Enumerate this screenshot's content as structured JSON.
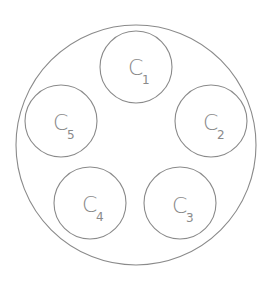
{
  "diagram": {
    "outer": {
      "name": "outer-circle"
    },
    "circles": [
      {
        "id": "c1",
        "letter": "C",
        "sub": "1"
      },
      {
        "id": "c2",
        "letter": "C",
        "sub": "2"
      },
      {
        "id": "c3",
        "letter": "C",
        "sub": "3"
      },
      {
        "id": "c4",
        "letter": "C",
        "sub": "4"
      },
      {
        "id": "c5",
        "letter": "C",
        "sub": "5"
      }
    ],
    "stroke_color": "#8a8a8a"
  }
}
